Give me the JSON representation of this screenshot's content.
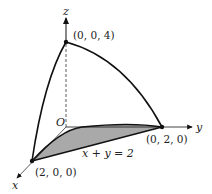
{
  "diagram": {
    "axes": {
      "x": "x",
      "y": "y",
      "z": "z",
      "origin": "O"
    },
    "points": {
      "z_intercept": "(0, 0, 4)",
      "y_intercept": "(0, 2, 0)",
      "x_intercept": "(2, 0, 0)"
    },
    "line_label": "x + y = 2",
    "colors": {
      "stroke": "#111111",
      "fill": "#a9a9a9"
    }
  }
}
